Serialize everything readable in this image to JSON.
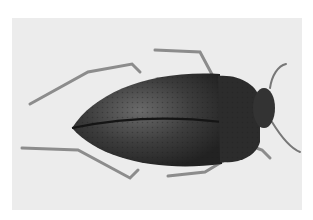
{
  "image": {
    "subject": "beetle",
    "description": "Top-down grayscale photograph of a dark, punctate-shelled beetle with long legs and antennae on a light gray background",
    "colors": {
      "background": "#ffffff",
      "panel": "#ececec",
      "body": "#3a3a3a",
      "body_dark": "#1e1e1e",
      "legs": "#8a8a8a"
    }
  }
}
